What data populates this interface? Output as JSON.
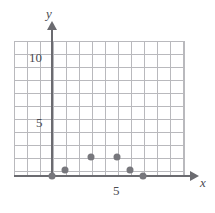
{
  "chart_data": {
    "type": "scatter",
    "title": "",
    "subtitle": "",
    "xlabel": "x",
    "ylabel": "y",
    "xlim": [
      -3,
      10
    ],
    "ylim": [
      0,
      13
    ],
    "grid": true,
    "legend": null,
    "x_ticks": [
      5
    ],
    "x_tick_labels": [
      "5"
    ],
    "y_ticks": [
      5,
      10
    ],
    "y_tick_labels": [
      "5",
      "10"
    ],
    "point_color": "#77777c",
    "axis_color": "#6b6b70",
    "grid_color": "#b9b9bd",
    "series": [
      {
        "name": "data",
        "points": [
          {
            "x": 0,
            "y": 0
          },
          {
            "x": 1,
            "y": 0.5
          },
          {
            "x": 3,
            "y": 1.5
          },
          {
            "x": 5,
            "y": 1.5
          },
          {
            "x": 6,
            "y": 0.5
          },
          {
            "x": 7,
            "y": 0
          }
        ]
      }
    ]
  },
  "axes": {
    "y_name": "y",
    "x_name": "x"
  },
  "ticks": {
    "y_10": "10",
    "y_5": "5",
    "x_5": "5"
  }
}
